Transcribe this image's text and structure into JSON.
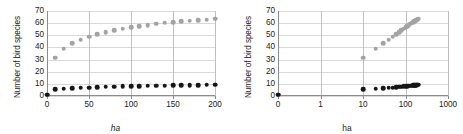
{
  "figure": {
    "panels": [
      {
        "id": "linear-panel",
        "ylabel": "Number of bird species",
        "xlabel": "ha"
      },
      {
        "id": "log-panel",
        "ylabel": "Number of bird species",
        "xlabel": "ha"
      }
    ]
  },
  "chart_data": [
    {
      "type": "scatter",
      "id": "species-area-linear",
      "title": "",
      "xlabel": "ha",
      "ylabel": "Number of bird species",
      "xscale": "linear",
      "yscale": "linear",
      "xlim": [
        0,
        200
      ],
      "ylim": [
        0,
        70
      ],
      "xticks": [
        0,
        50,
        100,
        150,
        200
      ],
      "yticks": [
        0,
        10,
        20,
        30,
        40,
        50,
        60,
        70
      ],
      "grid": "horizontal-and-vertical",
      "legend": "none",
      "series": [
        {
          "name": "upper-gray-series",
          "color": "#a3a3a3",
          "marker": "circle",
          "x": [
            0,
            10,
            20,
            30,
            40,
            50,
            60,
            70,
            80,
            90,
            100,
            110,
            120,
            130,
            140,
            150,
            160,
            170,
            180,
            190,
            200
          ],
          "y": [
            1,
            31.5,
            39,
            43.5,
            46.5,
            49,
            51,
            52.5,
            54,
            55.5,
            56.5,
            57.5,
            58.5,
            59.5,
            60.5,
            61,
            61.5,
            62,
            62.5,
            63,
            63.5
          ]
        },
        {
          "name": "lower-black-series",
          "color": "#161616",
          "marker": "circle",
          "x": [
            0,
            10,
            20,
            30,
            40,
            50,
            60,
            70,
            80,
            90,
            100,
            110,
            120,
            130,
            140,
            150,
            160,
            170,
            180,
            190,
            200
          ],
          "y": [
            1,
            5.5,
            6.0,
            6.4,
            6.8,
            7.0,
            7.2,
            7.5,
            7.7,
            7.9,
            8.1,
            8.2,
            8.4,
            8.5,
            8.6,
            8.8,
            8.9,
            9.0,
            9.1,
            9.2,
            9.3
          ]
        }
      ]
    },
    {
      "type": "scatter",
      "id": "species-area-log",
      "title": "",
      "xlabel": "ha",
      "ylabel": "Number of bird species",
      "xscale": "log",
      "yscale": "linear",
      "xlim": [
        0,
        1000
      ],
      "ylim": [
        0,
        70
      ],
      "xticks": [
        0,
        1,
        10,
        100,
        1000
      ],
      "yticks": [
        0,
        10,
        20,
        30,
        40,
        50,
        60,
        70
      ],
      "grid": "horizontal-and-vertical",
      "legend": "none",
      "series": [
        {
          "name": "upper-gray-series",
          "color": "#a3a3a3",
          "marker": "circle",
          "x": [
            0,
            10,
            20,
            30,
            40,
            50,
            60,
            70,
            80,
            90,
            100,
            110,
            120,
            130,
            140,
            150,
            160,
            170,
            180,
            190,
            200
          ],
          "y": [
            1,
            31.5,
            39,
            43.5,
            46.5,
            49,
            51,
            52.5,
            54,
            55.5,
            56.5,
            57.5,
            58.5,
            59.5,
            60.5,
            61,
            61.5,
            62,
            62.5,
            63,
            63.5
          ]
        },
        {
          "name": "lower-black-series",
          "color": "#161616",
          "marker": "circle",
          "x": [
            0,
            10,
            20,
            30,
            40,
            50,
            60,
            70,
            80,
            90,
            100,
            110,
            120,
            130,
            140,
            150,
            160,
            170,
            180,
            190,
            200
          ],
          "y": [
            1,
            5.5,
            6.0,
            6.4,
            6.8,
            7.0,
            7.2,
            7.5,
            7.7,
            7.9,
            8.1,
            8.2,
            8.4,
            8.5,
            8.6,
            8.8,
            8.9,
            9.0,
            9.1,
            9.2,
            9.3
          ]
        }
      ]
    }
  ]
}
